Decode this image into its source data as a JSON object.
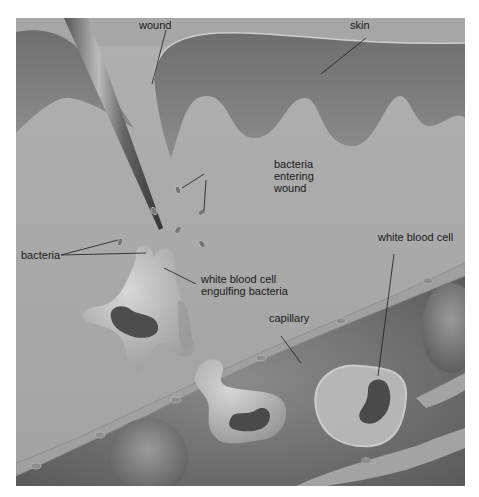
{
  "figure": {
    "colors": {
      "tissue": "#a9a9a9",
      "skin": "#8a8a8a",
      "skin_dark": "#6f6f6f",
      "capillary_wall": "#9a9a9a",
      "blood_bg": "#7c7c7c",
      "cell_light": "#c6c6c6",
      "nucleus": "#4a4a4a"
    },
    "labels": [
      {
        "id": "wound",
        "text": "wound"
      },
      {
        "id": "skin",
        "text": "skin"
      },
      {
        "id": "bacteria_entering_1",
        "text": "bacteria"
      },
      {
        "id": "bacteria_entering_2",
        "text": "entering"
      },
      {
        "id": "bacteria_entering_3",
        "text": "wound"
      },
      {
        "id": "bacteria",
        "text": "bacteria"
      },
      {
        "id": "wbc_engulf_1",
        "text": "white blood cell"
      },
      {
        "id": "wbc_engulf_2",
        "text": "engulfing bacteria"
      },
      {
        "id": "white_blood_cell",
        "text": "white blood cell"
      },
      {
        "id": "capillary",
        "text": "capillary"
      }
    ]
  }
}
